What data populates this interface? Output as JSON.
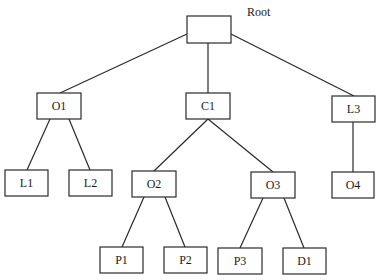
{
  "diagram": {
    "type": "tree",
    "root_caption": "Root",
    "nodes": [
      {
        "id": "root",
        "label": "",
        "x": 187,
        "y": 16,
        "w": 44,
        "h": 27
      },
      {
        "id": "O1",
        "label": "O1",
        "x": 37,
        "y": 93,
        "w": 44,
        "h": 26
      },
      {
        "id": "C1",
        "label": "C1",
        "x": 186,
        "y": 93,
        "w": 44,
        "h": 26
      },
      {
        "id": "L3",
        "label": "L3",
        "x": 332,
        "y": 96,
        "w": 43,
        "h": 26
      },
      {
        "id": "L1",
        "label": "L1",
        "x": 5,
        "y": 170,
        "w": 43,
        "h": 26
      },
      {
        "id": "L2",
        "label": "L2",
        "x": 69,
        "y": 170,
        "w": 43,
        "h": 26
      },
      {
        "id": "O2",
        "label": "O2",
        "x": 132,
        "y": 171,
        "w": 44,
        "h": 26
      },
      {
        "id": "O3",
        "label": "O3",
        "x": 251,
        "y": 172,
        "w": 44,
        "h": 26
      },
      {
        "id": "O4",
        "label": "O4",
        "x": 332,
        "y": 172,
        "w": 42,
        "h": 26
      },
      {
        "id": "P1",
        "label": "P1",
        "x": 100,
        "y": 247,
        "w": 43,
        "h": 26
      },
      {
        "id": "P2",
        "label": "P2",
        "x": 164,
        "y": 247,
        "w": 43,
        "h": 26
      },
      {
        "id": "P3",
        "label": "P3",
        "x": 218,
        "y": 248,
        "w": 44,
        "h": 26
      },
      {
        "id": "D1",
        "label": "D1",
        "x": 283,
        "y": 248,
        "w": 43,
        "h": 26
      }
    ],
    "edges": [
      {
        "from": "root",
        "to": "O1",
        "x1": 187,
        "y1": 34,
        "x2": 60,
        "y2": 93
      },
      {
        "from": "root",
        "to": "C1",
        "x1": 208,
        "y1": 43,
        "x2": 208,
        "y2": 93
      },
      {
        "from": "root",
        "to": "L3",
        "x1": 231,
        "y1": 34,
        "x2": 354,
        "y2": 96
      },
      {
        "from": "O1",
        "to": "L1",
        "x1": 50,
        "y1": 119,
        "x2": 27,
        "y2": 170
      },
      {
        "from": "O1",
        "to": "L2",
        "x1": 69,
        "y1": 119,
        "x2": 90,
        "y2": 170
      },
      {
        "from": "C1",
        "to": "O2",
        "x1": 208,
        "y1": 119,
        "x2": 154,
        "y2": 171
      },
      {
        "from": "C1",
        "to": "O3",
        "x1": 208,
        "y1": 119,
        "x2": 273,
        "y2": 172
      },
      {
        "from": "L3",
        "to": "O4",
        "x1": 353,
        "y1": 122,
        "x2": 353,
        "y2": 172
      },
      {
        "from": "O2",
        "to": "P1",
        "x1": 144,
        "y1": 197,
        "x2": 122,
        "y2": 247
      },
      {
        "from": "O2",
        "to": "P2",
        "x1": 165,
        "y1": 197,
        "x2": 185,
        "y2": 247
      },
      {
        "from": "O3",
        "to": "P3",
        "x1": 263,
        "y1": 198,
        "x2": 240,
        "y2": 248
      },
      {
        "from": "O3",
        "to": "D1",
        "x1": 284,
        "y1": 198,
        "x2": 304,
        "y2": 248
      }
    ]
  }
}
